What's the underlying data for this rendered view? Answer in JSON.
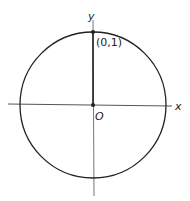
{
  "diagram": {
    "title": "",
    "center_label": "O",
    "point_label": "(0,1)",
    "x_axis_label": "x",
    "y_axis_label": "y",
    "circle": {
      "cx": 93,
      "cy": 104,
      "r": 73
    },
    "stroke_color": "#222222"
  }
}
